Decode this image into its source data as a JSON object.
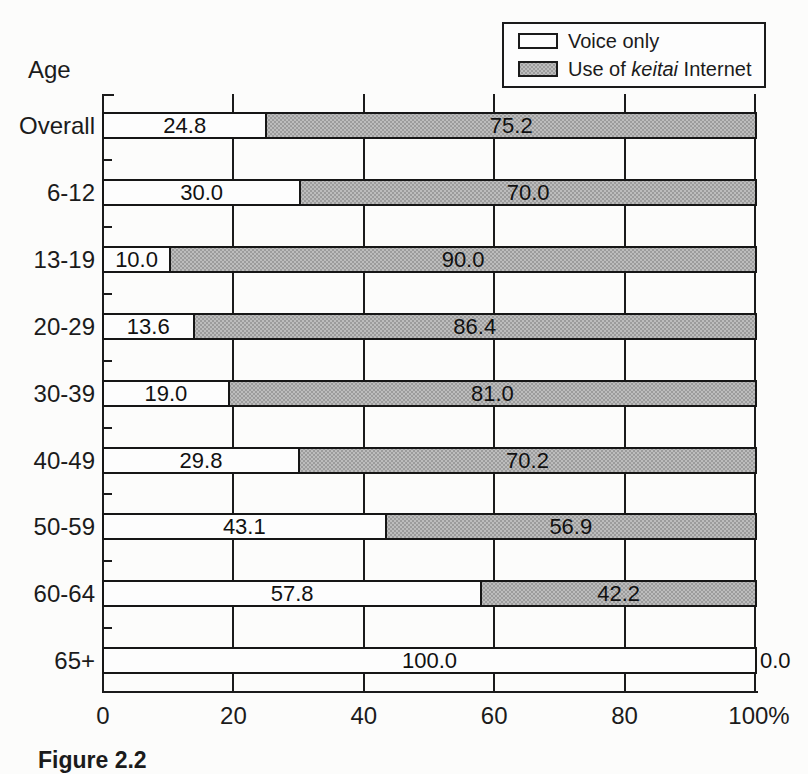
{
  "figure": {
    "axis_title": "Age",
    "caption": "Figure 2.2"
  },
  "legend": {
    "items": [
      {
        "label": "Voice only"
      },
      {
        "prefix": "Use of ",
        "italic": "keitai",
        "suffix": " Internet"
      }
    ]
  },
  "chart_data": {
    "type": "bar",
    "orientation": "horizontal",
    "stacked": true,
    "title": "",
    "ylabel": "Age",
    "xlabel": "",
    "xlim": [
      0,
      100
    ],
    "grid": true,
    "legend_position": "top-right",
    "value_labels": true,
    "x_tick_values": [
      0,
      20,
      40,
      60,
      80,
      100
    ],
    "x_ticks": [
      "0",
      "20",
      "40",
      "60",
      "80",
      "100%"
    ],
    "categories": [
      "Overall",
      "6-12",
      "13-19",
      "20-29",
      "30-39",
      "40-49",
      "50-59",
      "60-64",
      "65+"
    ],
    "series": [
      {
        "name": "Voice only",
        "color": "#fdfdfd",
        "values": [
          24.8,
          30.0,
          10.0,
          13.6,
          19.0,
          29.8,
          43.1,
          57.8,
          100.0
        ]
      },
      {
        "name": "Use of keitai Internet",
        "color": "#b5b5b5",
        "values": [
          75.2,
          70.0,
          90.0,
          86.4,
          81.0,
          70.2,
          56.9,
          42.2,
          0.0
        ]
      }
    ]
  }
}
